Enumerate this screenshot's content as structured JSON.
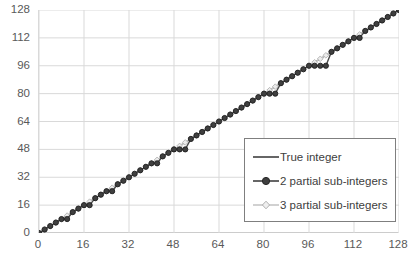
{
  "chart_data": {
    "type": "line",
    "title": "",
    "xlabel": "",
    "ylabel": "",
    "xlim": [
      0,
      128
    ],
    "ylim": [
      0,
      128
    ],
    "grid": true,
    "legend_position": "lower-right-inside",
    "xticks": [
      "0",
      "16",
      "32",
      "48",
      "64",
      "80",
      "96",
      "112",
      "128"
    ],
    "yticks": [
      "0",
      "16",
      "32",
      "48",
      "64",
      "80",
      "96",
      "112",
      "128"
    ],
    "xtick_values": [
      0,
      16,
      32,
      48,
      64,
      80,
      96,
      112,
      128
    ],
    "ytick_values": [
      0,
      16,
      32,
      48,
      64,
      80,
      96,
      112,
      128
    ],
    "series": [
      {
        "name": "True integer",
        "style": "line",
        "color": "#404040",
        "x": [
          0,
          128
        ],
        "values": [
          0,
          128
        ]
      },
      {
        "name": "2 partial sub-integers",
        "style": "line-marker",
        "marker": "circle",
        "color": "#404040",
        "x": [
          0,
          2,
          4,
          6,
          8,
          10,
          12,
          14,
          16,
          18,
          20,
          22,
          24,
          26,
          28,
          30,
          32,
          34,
          36,
          38,
          40,
          42,
          44,
          46,
          48,
          50,
          52,
          54,
          56,
          58,
          60,
          62,
          64,
          66,
          68,
          70,
          72,
          74,
          76,
          78,
          80,
          82,
          84,
          86,
          88,
          90,
          92,
          94,
          96,
          98,
          100,
          102,
          104,
          106,
          108,
          110,
          112,
          114,
          116,
          118,
          120,
          122,
          124,
          126,
          128
        ],
        "values": [
          0,
          2,
          4,
          6,
          8,
          8,
          12,
          14,
          16,
          16,
          20,
          22,
          24,
          24,
          28,
          30,
          32,
          34,
          36,
          38,
          40,
          40,
          44,
          46,
          48,
          48,
          48,
          54,
          56,
          58,
          60,
          62,
          64,
          66,
          68,
          70,
          72,
          74,
          76,
          78,
          80,
          80,
          80,
          86,
          88,
          90,
          92,
          94,
          96,
          96,
          96,
          96,
          104,
          106,
          108,
          110,
          112,
          112,
          116,
          118,
          120,
          122,
          124,
          126,
          128
        ]
      },
      {
        "name": "3 partial sub-integers",
        "style": "line-marker",
        "marker": "diamond",
        "color": "#bfbfbf",
        "x": [
          0,
          2,
          4,
          6,
          8,
          10,
          12,
          14,
          16,
          18,
          20,
          22,
          24,
          26,
          28,
          30,
          32,
          34,
          36,
          38,
          40,
          42,
          44,
          46,
          48,
          50,
          52,
          54,
          56,
          58,
          60,
          62,
          64,
          66,
          68,
          70,
          72,
          74,
          76,
          78,
          80,
          82,
          84,
          86,
          88,
          90,
          92,
          94,
          96,
          98,
          100,
          102,
          104,
          106,
          108,
          110,
          112,
          114,
          116,
          118,
          120,
          122,
          124,
          126,
          128
        ],
        "values": [
          0,
          2,
          4,
          6,
          8,
          10,
          12,
          14,
          16,
          18,
          20,
          22,
          24,
          26,
          28,
          30,
          32,
          34,
          36,
          38,
          40,
          42,
          44,
          46,
          48,
          50,
          52,
          54,
          56,
          58,
          60,
          62,
          64,
          66,
          68,
          70,
          72,
          74,
          76,
          78,
          80,
          82,
          84,
          86,
          88,
          90,
          92,
          94,
          96,
          98,
          100,
          102,
          104,
          106,
          108,
          110,
          112,
          114,
          116,
          118,
          120,
          122,
          124,
          126,
          128
        ]
      }
    ]
  },
  "legend": {
    "items": [
      {
        "label": "True integer",
        "marker": "none"
      },
      {
        "label": "2 partial sub-integers",
        "marker": "circle"
      },
      {
        "label": "3 partial sub-integers",
        "marker": "diamond"
      }
    ]
  },
  "colors": {
    "grid": "#d9d9d9",
    "axis": "#bfbfbf",
    "tick_text": "#595959",
    "series_dark": "#404040",
    "series_light": "#bfbfbf",
    "legend_border": "#7f7f7f",
    "background": "#ffffff"
  }
}
